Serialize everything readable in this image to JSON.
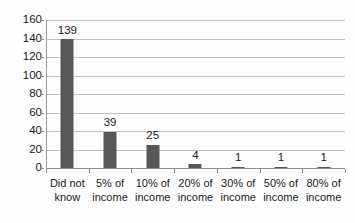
{
  "chart_data": {
    "type": "bar",
    "title": "",
    "subtitle": "",
    "xlabel": "",
    "ylabel": "",
    "ylim": [
      0,
      160
    ],
    "ytick_step": 20,
    "yticks": [
      "0",
      "20",
      "40",
      "60",
      "80",
      "100",
      "120",
      "140",
      "160"
    ],
    "grid": true,
    "legend": false,
    "legend_position": "none",
    "bar_color": "#575757",
    "gridline_color": "#c2c2c2",
    "axis_color": "#8f8f8f",
    "categories": [
      "Did not know",
      "5% of income",
      "10% of income",
      "20% of income",
      "30% of income",
      "50% of income",
      "80% of income"
    ],
    "category_lines": [
      [
        "Did not",
        "know"
      ],
      [
        "5% of",
        "income"
      ],
      [
        "10% of",
        "income"
      ],
      [
        "20% of",
        "income"
      ],
      [
        "30% of",
        "income"
      ],
      [
        "50% of",
        "income"
      ],
      [
        "80% of",
        "income"
      ]
    ],
    "values": [
      139,
      39,
      25,
      4,
      1,
      1,
      1
    ],
    "data_labels": [
      "139",
      "39",
      "25",
      "4",
      "1",
      "1",
      "1"
    ]
  }
}
